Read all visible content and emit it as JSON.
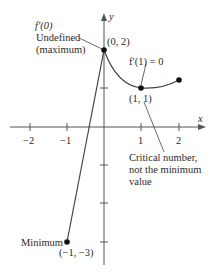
{
  "axes": {
    "x_label": "x",
    "y_label": "y",
    "x_ticks": [
      "−2",
      "−1",
      "1",
      "2"
    ]
  },
  "points": {
    "max": "(0, 2)",
    "critical": "(1, 1)",
    "min": "(−1, −3)"
  },
  "annotations": {
    "fprime0": "f′(0)",
    "undefined": "Undefined",
    "maximum": "(maximum)",
    "fprime1": "f′(1) = 0",
    "critical_line1": "Critical number,",
    "critical_line2": "not the minimum",
    "critical_line3": "value",
    "minimum": "Minimum"
  },
  "colors": {
    "line": "#4a4a4a",
    "text": "#2a2a2a"
  }
}
